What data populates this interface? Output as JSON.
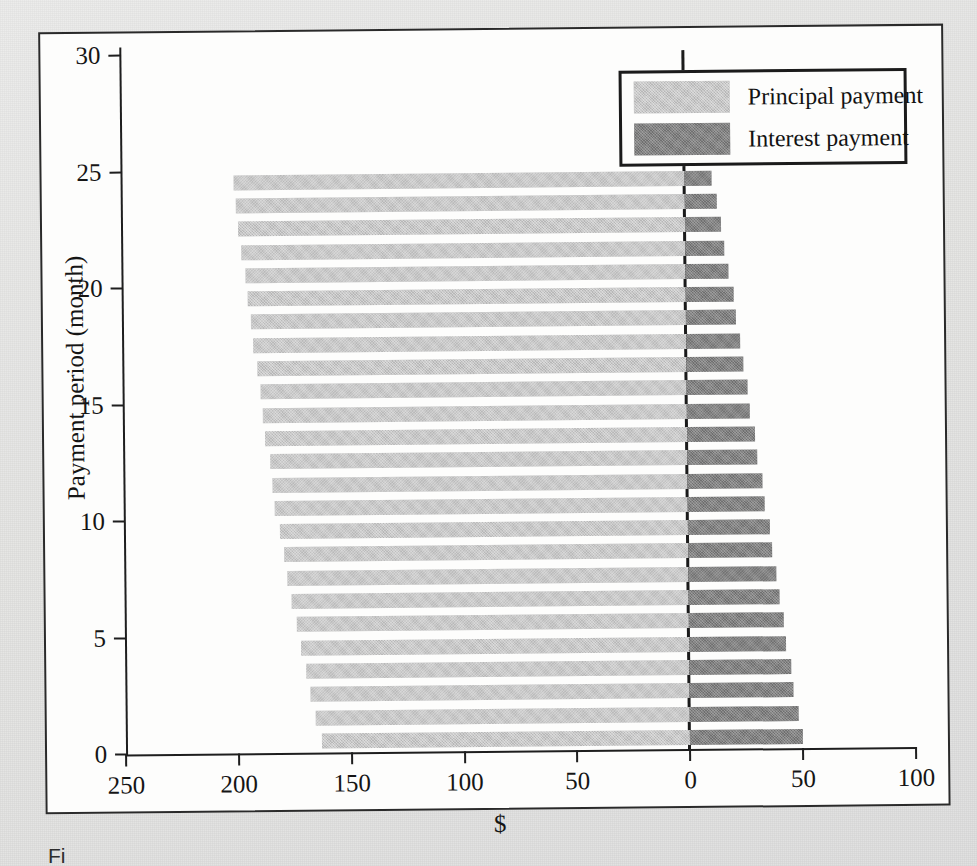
{
  "figure": {
    "caption_fragment": "Fi"
  },
  "legend": {
    "items": [
      {
        "label": "Principal payment",
        "color": "#b7b7b7",
        "key": "principal"
      },
      {
        "label": "Interest payment",
        "color": "#6f6f6f",
        "key": "interest"
      }
    ]
  },
  "axes": {
    "x_title": "$",
    "y_title": "Payment period (month)",
    "x_tick_labels": [
      "250",
      "200",
      "150",
      "100",
      "50",
      "0",
      "50",
      "100"
    ],
    "x_tick_values": [
      -250,
      -200,
      -150,
      -100,
      -50,
      0,
      50,
      100
    ],
    "y_tick_labels": [
      "0",
      "5",
      "10",
      "15",
      "20",
      "25",
      "30"
    ],
    "y_tick_values": [
      0,
      5,
      10,
      15,
      20,
      25,
      30
    ]
  },
  "chart_data": {
    "type": "bar",
    "orientation": "horizontal",
    "stacked": "diverging",
    "title": "",
    "subtitle": "",
    "xlabel": "$",
    "ylabel": "Payment period (month)",
    "xlim": [
      -250,
      100
    ],
    "ylim": [
      0,
      30
    ],
    "grid": false,
    "legend_position": "top-right",
    "categories": [
      1,
      2,
      3,
      4,
      5,
      6,
      7,
      8,
      9,
      10,
      11,
      12,
      13,
      14,
      15,
      16,
      17,
      18,
      19,
      20,
      21,
      22,
      23,
      24,
      25
    ],
    "series": [
      {
        "name": "Principal payment",
        "color": "#b7b7b7",
        "direction": "left",
        "values": [
          163,
          166,
          168,
          170,
          172,
          174,
          176,
          178,
          179,
          181,
          183,
          184,
          185,
          187,
          188,
          189,
          190,
          192,
          193,
          194,
          195,
          197,
          198,
          199,
          200
        ]
      },
      {
        "name": "Interest payment",
        "color": "#6f6f6f",
        "direction": "right",
        "values": [
          50,
          48,
          46,
          45,
          43,
          42,
          40,
          39,
          37,
          36,
          34,
          33,
          31,
          30,
          28,
          27,
          25,
          24,
          22,
          21,
          19,
          17,
          16,
          14,
          12
        ]
      }
    ]
  }
}
